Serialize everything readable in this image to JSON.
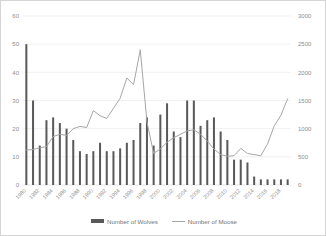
{
  "title": "",
  "legend": {
    "wolves_label": "Number of Wolves",
    "moose_label": "Number of Moose"
  },
  "colors": {
    "bar": "#595959",
    "line": "#a6a6a6",
    "grid": "#e8e8e8",
    "tick_text": "#8c8c8c",
    "frame": "#d4d4d4"
  },
  "chart_data": {
    "type": "bar",
    "title": "",
    "xlabel": "",
    "ylabel": "Number of Wolves",
    "y2label": "Number of Moose",
    "ylim": [
      0,
      60
    ],
    "y2lim": [
      0,
      3000
    ],
    "yticks": [
      0,
      10,
      20,
      30,
      40,
      50,
      60
    ],
    "y2ticks": [
      0,
      500,
      1000,
      1500,
      2000,
      2500,
      3000
    ],
    "grid": true,
    "legend_position": "bottom",
    "categories": [
      1980,
      1981,
      1982,
      1983,
      1984,
      1985,
      1986,
      1987,
      1988,
      1989,
      1990,
      1991,
      1992,
      1993,
      1994,
      1995,
      1996,
      1997,
      1998,
      1999,
      2000,
      2001,
      2002,
      2003,
      2004,
      2005,
      2006,
      2007,
      2008,
      2009,
      2010,
      2011,
      2012,
      2013,
      2014,
      2015,
      2016,
      2017,
      2018,
      2019
    ],
    "xtick_labels": [
      "1980",
      "",
      "1982",
      "",
      "1984",
      "",
      "1986",
      "",
      "1988",
      "",
      "1990",
      "",
      "1992",
      "",
      "1994",
      "",
      "1996",
      "",
      "1998",
      "",
      "2000",
      "",
      "2002",
      "",
      "2004",
      "",
      "2006",
      "",
      "2008",
      "",
      "2010",
      "",
      "2012",
      "",
      "2014",
      "",
      "2016",
      "",
      "2018",
      ""
    ],
    "series": [
      {
        "name": "Number of Wolves",
        "type": "bar",
        "axis": "left",
        "values": [
          50,
          30,
          14,
          23,
          24,
          22,
          20,
          16,
          12,
          11,
          12,
          15,
          12,
          12,
          13,
          15,
          16,
          22,
          24,
          14,
          25,
          29,
          19,
          17,
          30,
          30,
          21,
          23,
          24,
          19,
          16,
          9,
          9,
          8,
          3,
          2,
          2,
          2,
          2,
          2
        ]
      },
      {
        "name": "Number of Moose",
        "type": "line",
        "axis": "right",
        "values": [
          620,
          630,
          660,
          680,
          860,
          900,
          880,
          1000,
          1040,
          1020,
          1320,
          1230,
          1180,
          1360,
          1540,
          1900,
          1780,
          2400,
          1120,
          560,
          640,
          760,
          840,
          900,
          960,
          980,
          900,
          780,
          640,
          540,
          510,
          520,
          650,
          560,
          540,
          520,
          730,
          1050,
          1240,
          1530
        ]
      }
    ]
  }
}
